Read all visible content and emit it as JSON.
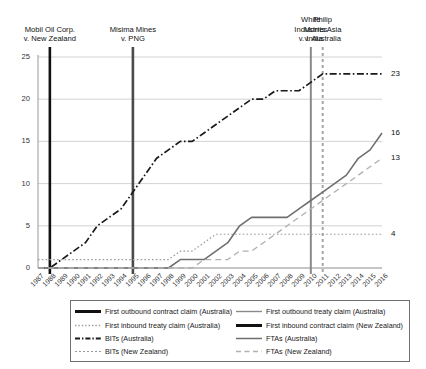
{
  "chart_data": {
    "type": "line",
    "title": "",
    "xlabel": "",
    "ylabel": "",
    "ylim": [
      0,
      25
    ],
    "yticks": [
      0,
      5,
      10,
      15,
      20,
      25
    ],
    "grid": true,
    "legend_position": "bottom",
    "categories": [
      "1987",
      "1988",
      "1989",
      "1990",
      "1991",
      "1992",
      "1993",
      "1994",
      "1995",
      "1996",
      "1997",
      "1998",
      "1999",
      "2000",
      "2001",
      "2002",
      "2003",
      "2004",
      "2005",
      "2006",
      "2007",
      "2008",
      "2009",
      "2010",
      "2011",
      "2012",
      "2013",
      "2014",
      "2015",
      "2016"
    ],
    "series": [
      {
        "name": "BITs (Australia)",
        "style": "dash-dot",
        "color": "#1a1a1a",
        "end_label": "23",
        "values": [
          0,
          0,
          1,
          2,
          3,
          5,
          6,
          7,
          9,
          11,
          13,
          14,
          15,
          15,
          16,
          17,
          18,
          19,
          20,
          20,
          21,
          21,
          21,
          22,
          23,
          23,
          23,
          23,
          23,
          23
        ]
      },
      {
        "name": "BITs (New Zealand)",
        "style": "dotted",
        "color": "#9a9a9a",
        "end_label": "4",
        "values": [
          1,
          1,
          1,
          1,
          1,
          1,
          1,
          1,
          1,
          1,
          1,
          1,
          2,
          2,
          3,
          4,
          4,
          4,
          4,
          4,
          4,
          4,
          4,
          4,
          4,
          4,
          4,
          4,
          4,
          4
        ]
      },
      {
        "name": "FTAs (Australia)",
        "style": "solid",
        "color": "#6f6f6f",
        "end_label": "16",
        "values": [
          0,
          0,
          0,
          0,
          0,
          0,
          0,
          0,
          0,
          0,
          0,
          0,
          1,
          1,
          1,
          2,
          3,
          5,
          6,
          6,
          6,
          6,
          7,
          8,
          9,
          10,
          11,
          13,
          14,
          16
        ]
      },
      {
        "name": "FTAs (New Zealand)",
        "style": "dashed",
        "color": "#b0b0b0",
        "end_label": "13",
        "values": [
          0,
          0,
          0,
          0,
          0,
          0,
          0,
          0,
          0,
          0,
          0,
          0,
          0,
          0,
          1,
          1,
          1,
          2,
          2,
          3,
          4,
          5,
          6,
          7,
          8,
          9,
          10,
          11,
          12,
          13
        ]
      }
    ],
    "events": [
      {
        "name": "mobil-oil",
        "label_lines": [
          "Mobil Oil Corp.",
          "v. New Zealand"
        ],
        "year": "1988",
        "style": "solid",
        "color": "#111111",
        "width": 2.6
      },
      {
        "name": "misima-mines",
        "label_lines": [
          "Misima Mines",
          "v. PNG"
        ],
        "year": "1995",
        "style": "solid",
        "color": "#4a4a4a",
        "width": 2.6
      },
      {
        "name": "white-industries",
        "label_lines": [
          "White",
          "Industries",
          "v. India"
        ],
        "year": "2010",
        "style": "solid",
        "color": "#8a8a8a",
        "width": 2.0
      },
      {
        "name": "philip-morris",
        "label_lines": [
          "Philip",
          "Morris Asia",
          "v. Australia"
        ],
        "year": "2011",
        "style": "dashed",
        "color": "#a6a6a6",
        "width": 2.0
      }
    ]
  },
  "legend": {
    "items": [
      {
        "label": "First outbound contract claim (Australia)",
        "swatch": "thick-solid-black",
        "color": "#111111"
      },
      {
        "label": "First outbound treaty claim (Australia)",
        "swatch": "thin-solid-gray",
        "color": "#8a8a8a"
      },
      {
        "label": "First inbound treaty claim (Australia)",
        "swatch": "dotted-gray",
        "color": "#9a9a9a"
      },
      {
        "label": "First inbound contract claim (New Zealand)",
        "swatch": "thick-solid-black",
        "color": "#111111"
      },
      {
        "label": "BITs (Australia)",
        "swatch": "dash-dot-black",
        "color": "#1a1a1a"
      },
      {
        "label": "FTAs (Australia)",
        "swatch": "solid-gray",
        "color": "#6f6f6f"
      },
      {
        "label": "BITs (New Zealand)",
        "swatch": "fine-dashed-gray",
        "color": "#9a9a9a"
      },
      {
        "label": "FTAs (New Zealand)",
        "swatch": "dashed-gray",
        "color": "#b0b0b0"
      }
    ]
  }
}
